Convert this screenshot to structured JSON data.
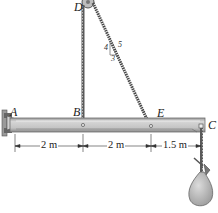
{
  "diagram": {
    "type": "statics-beam",
    "points": {
      "A": "A",
      "B": "B",
      "C": "C",
      "D": "D",
      "E": "E"
    },
    "dimensions": [
      {
        "from": "A",
        "to": "B",
        "label": "2 m"
      },
      {
        "from": "B",
        "to": "E",
        "label": "2 m"
      },
      {
        "from": "E",
        "to": "C",
        "label": "1.5 m"
      }
    ],
    "slope_triangle": {
      "rise": "4",
      "run": "3",
      "hypotenuse": "5"
    },
    "colors": {
      "beam_fill": "#c8c8c8",
      "beam_edge": "#6e6e6e",
      "cable": "#555555",
      "bag_fill": "#bdbdbd"
    }
  }
}
